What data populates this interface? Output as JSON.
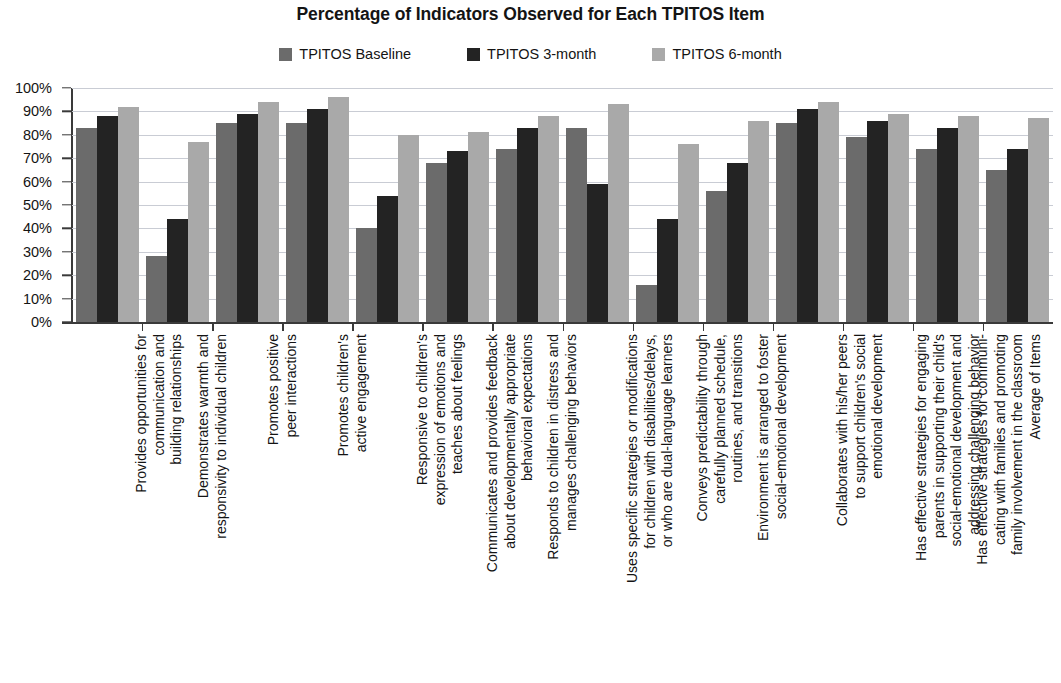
{
  "chart_data": {
    "type": "bar",
    "title": "Percentage of Indicators Observed for Each TPITOS Item",
    "xlabel": "",
    "ylabel": "",
    "ylim": [
      0,
      100
    ],
    "ytick_labels": [
      "100%",
      "90%",
      "80%",
      "70%",
      "60%",
      "50%",
      "40%",
      "30%",
      "20%",
      "10%",
      "0%"
    ],
    "ytick_values": [
      100,
      90,
      80,
      70,
      60,
      50,
      40,
      30,
      20,
      10,
      0
    ],
    "grid": true,
    "legend_position": "top-center",
    "categories": [
      "Provides opportunities for communication and building relationships",
      "Demonstrates warmth and responsivity to individual children",
      "Promotes positive peer interactions",
      "Promotes children's active engagement",
      "Responsive to children's expression of emotions and teaches about feelings",
      "Communicates and provides feedback about developmentally appropriate behavioral expectations",
      "Responds to children in distress and manages challenging behaviors",
      "Uses specific strategies or modifications for children with disabilities/delays, or who are dual-language learners",
      "Conveys predictability through carefully planned schedule, routines, and transitions",
      "Environment is arranged to foster social-emotional development",
      "Collaborates with his/her peers to support children's social emotional development",
      "Has effective strategies for engaging parents in supporting their child's social-emotional development and addressing challenging behavior",
      "Has effective strategies for communicating with families and promoting family involvement in the classroom",
      "Average of Items"
    ],
    "category_lines": [
      [
        "Provides opportunities for",
        "communication and",
        "building relationships"
      ],
      [
        "Demonstrates warmth and",
        "responsivity to individual children"
      ],
      [
        "Promotes positive",
        "peer interactions"
      ],
      [
        "Promotes children's",
        "active engagement"
      ],
      [
        "Responsive to children's",
        "expression of emotions and",
        "teaches about feelings"
      ],
      [
        "Communicates and provides feedback",
        "about developmentally appropriate",
        "behavioral expectations"
      ],
      [
        "Responds to children in distress and",
        "manages challenging behaviors"
      ],
      [
        "Uses specific strategies or modifications",
        "for children with disabilities/delays,",
        "or who are dual-language learners"
      ],
      [
        "Conveys predictability through",
        "carefully planned schedule,",
        "routines, and transitions"
      ],
      [
        "Environment is arranged to foster",
        "social-emotional development"
      ],
      [
        "Collaborates with his/her peers",
        "to support children's social",
        "emotional development"
      ],
      [
        "Has effective strategies for engaging",
        "parents in supporting their child's",
        "social-emotional development and",
        "addressing challenging behavior"
      ],
      [
        "Has effective strategies for communi-",
        "cating with families and promoting",
        "family involvement in the classroom"
      ],
      [
        "Average of Items"
      ]
    ],
    "series": [
      {
        "name": "TPITOS Baseline",
        "color": "#6b6b6b",
        "values": [
          83,
          28,
          85,
          85,
          40,
          68,
          74,
          83,
          16,
          56,
          85,
          79,
          74,
          65
        ]
      },
      {
        "name": "TPITOS 3-month",
        "color": "#232323",
        "values": [
          88,
          44,
          89,
          91,
          54,
          73,
          83,
          59,
          44,
          68,
          91,
          86,
          83,
          74
        ]
      },
      {
        "name": "TPITOS 6-month",
        "color": "#a9a9a9",
        "values": [
          92,
          77,
          94,
          96,
          80,
          81,
          88,
          93,
          76,
          86,
          94,
          89,
          88,
          87
        ]
      }
    ],
    "colors": {
      "baseline": "#6b6b6b",
      "three_month": "#232323",
      "six_month": "#a9a9a9",
      "gridline": "#c9ccd4",
      "axis": "#3a3a3a",
      "text": "#141414",
      "background": "#ffffff"
    }
  }
}
